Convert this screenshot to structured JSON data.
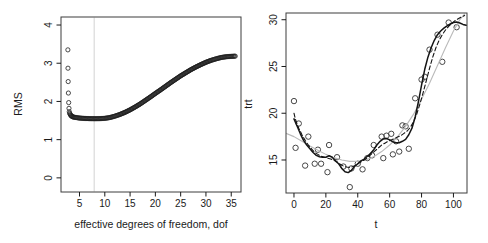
{
  "figure": {
    "background": "#ffffff",
    "width": 488,
    "height": 243
  },
  "chart_data": [
    {
      "type": "scatter",
      "title": "",
      "xlabel": "effective degrees of freedom, dof",
      "ylabel": "RMS",
      "xticks": [
        5,
        10,
        15,
        20,
        25,
        30,
        35
      ],
      "yticks": [
        0,
        1,
        2,
        3,
        4
      ],
      "xlim": [
        1.34,
        36.93
      ],
      "ylim": [
        -0.37,
        4.21
      ],
      "grid": false,
      "legend": "none",
      "marker": "open-circle",
      "ref_line": {
        "x": 7.9,
        "color": "#d6d6d6",
        "note": "vertical light line marking minimum-RMS dof"
      },
      "points": [
        [
          2.7,
          3.35
        ],
        [
          2.72,
          2.87
        ],
        [
          2.76,
          2.52
        ],
        [
          2.8,
          2.22
        ],
        [
          2.86,
          1.97
        ],
        [
          2.92,
          1.82
        ],
        [
          2.98,
          1.73
        ]
      ],
      "curve_of_overlapping_circles": [
        [
          3.05,
          1.69
        ],
        [
          3.3,
          1.63
        ],
        [
          3.6,
          1.6
        ],
        [
          4.0,
          1.585
        ],
        [
          4.5,
          1.575
        ],
        [
          5,
          1.565
        ],
        [
          6,
          1.555
        ],
        [
          7,
          1.55
        ],
        [
          8,
          1.548
        ],
        [
          9,
          1.55
        ],
        [
          10,
          1.558
        ],
        [
          11,
          1.578
        ],
        [
          12,
          1.615
        ],
        [
          13,
          1.66
        ],
        [
          14,
          1.715
        ],
        [
          15,
          1.78
        ],
        [
          16,
          1.855
        ],
        [
          17,
          1.935
        ],
        [
          18,
          2.025
        ],
        [
          19,
          2.115
        ],
        [
          20,
          2.21
        ],
        [
          21,
          2.3
        ],
        [
          22,
          2.395
        ],
        [
          23,
          2.49
        ],
        [
          24,
          2.58
        ],
        [
          25,
          2.67
        ],
        [
          26,
          2.75
        ],
        [
          27,
          2.83
        ],
        [
          28,
          2.9
        ],
        [
          29,
          2.965
        ],
        [
          30,
          3.025
        ],
        [
          31,
          3.075
        ],
        [
          32,
          3.115
        ],
        [
          33,
          3.15
        ],
        [
          34,
          3.17
        ],
        [
          35,
          3.18
        ],
        [
          35.8,
          3.185
        ]
      ]
    },
    {
      "type": "scatter",
      "title": "",
      "xlabel": "t",
      "ylabel": "trt",
      "xticks": [
        0,
        20,
        40,
        60,
        80,
        100
      ],
      "yticks": [
        15,
        20,
        25,
        30
      ],
      "xlim": [
        -5.0,
        108.5
      ],
      "ylim": [
        11.47,
        30.72
      ],
      "grid": false,
      "legend": "none",
      "marker": "open-circle",
      "points": [
        [
          0,
          21.3
        ],
        [
          1,
          16.3
        ],
        [
          3,
          18.9
        ],
        [
          7,
          14.4
        ],
        [
          9,
          17.5
        ],
        [
          13,
          14.6
        ],
        [
          15,
          16.1
        ],
        [
          17,
          14.6
        ],
        [
          21,
          13.7
        ],
        [
          22,
          16.6
        ],
        [
          27,
          15.3
        ],
        [
          31,
          14.3
        ],
        [
          35,
          12.1
        ],
        [
          36,
          14.1
        ],
        [
          40,
          14.6
        ],
        [
          43,
          14.0
        ],
        [
          46,
          15.2
        ],
        [
          49,
          15.5
        ],
        [
          50,
          16.6
        ],
        [
          55,
          17.5
        ],
        [
          56,
          15.2
        ],
        [
          58,
          17.6
        ],
        [
          61,
          17.8
        ],
        [
          62,
          15.6
        ],
        [
          64,
          17.0
        ],
        [
          66,
          15.9
        ],
        [
          68,
          18.7
        ],
        [
          70,
          18.6
        ],
        [
          72,
          16.2
        ],
        [
          76,
          21.6
        ],
        [
          80,
          23.6
        ],
        [
          82,
          23.9
        ],
        [
          85,
          26.8
        ],
        [
          90,
          28.4
        ],
        [
          93,
          25.5
        ],
        [
          97,
          29.7
        ],
        [
          102,
          29.2
        ]
      ],
      "series": [
        {
          "name": "thick-solid-smoother",
          "style": "solid",
          "color": "#141414",
          "width": 1.5,
          "points": [
            [
              0,
              19.4
            ],
            [
              2,
              18.6
            ],
            [
              4,
              17.8
            ],
            [
              6,
              17.1
            ],
            [
              8,
              16.6
            ],
            [
              10,
              16.2
            ],
            [
              12,
              15.8
            ],
            [
              14,
              15.5
            ],
            [
              16,
              15.35
            ],
            [
              18,
              15.3
            ],
            [
              20,
              15.3
            ],
            [
              22,
              15.45
            ],
            [
              24,
              15.3
            ],
            [
              26,
              14.9
            ],
            [
              28,
              14.6
            ],
            [
              30,
              14.1
            ],
            [
              32,
              13.75
            ],
            [
              34,
              13.65
            ],
            [
              36,
              13.9
            ],
            [
              38,
              14.3
            ],
            [
              40,
              14.6
            ],
            [
              42,
              14.9
            ],
            [
              44,
              15.1
            ],
            [
              46,
              15.4
            ],
            [
              48,
              15.7
            ],
            [
              50,
              16.1
            ],
            [
              52,
              16.6
            ],
            [
              54,
              17.0
            ],
            [
              56,
              17.25
            ],
            [
              58,
              17.3
            ],
            [
              60,
              17.15
            ],
            [
              62,
              16.95
            ],
            [
              64,
              16.85
            ],
            [
              66,
              16.85
            ],
            [
              68,
              17.0
            ],
            [
              70,
              17.2
            ],
            [
              72,
              17.7
            ],
            [
              74,
              18.4
            ],
            [
              76,
              19.6
            ],
            [
              78,
              21.2
            ],
            [
              80,
              23.0
            ],
            [
              82,
              24.7
            ],
            [
              84,
              26.0
            ],
            [
              86,
              27.0
            ],
            [
              88,
              27.8
            ],
            [
              90,
              28.4
            ],
            [
              92,
              28.8
            ],
            [
              94,
              29.1
            ],
            [
              96,
              29.35
            ],
            [
              98,
              29.55
            ],
            [
              100,
              29.7
            ],
            [
              102,
              29.75
            ],
            [
              104,
              29.65
            ],
            [
              106,
              29.5
            ],
            [
              108,
              29.4
            ]
          ]
        },
        {
          "name": "dashed-smoother",
          "style": "dashed",
          "color": "#141414",
          "width": 1.1,
          "points": [
            [
              0,
              20.0
            ],
            [
              1,
              19.3
            ],
            [
              3,
              18.4
            ],
            [
              5,
              17.7
            ],
            [
              7,
              17.1
            ],
            [
              9,
              16.6
            ],
            [
              11,
              16.2
            ],
            [
              13,
              15.8
            ],
            [
              15,
              15.6
            ],
            [
              17,
              15.4
            ],
            [
              19,
              15.3
            ],
            [
              21,
              15.2
            ],
            [
              23,
              15.1
            ],
            [
              25,
              15.0
            ],
            [
              27,
              14.8
            ],
            [
              29,
              14.55
            ],
            [
              31,
              14.35
            ],
            [
              33,
              14.25
            ],
            [
              35,
              14.2
            ],
            [
              37,
              14.3
            ],
            [
              39,
              14.45
            ],
            [
              41,
              14.7
            ],
            [
              43,
              14.9
            ],
            [
              45,
              15.1
            ],
            [
              47,
              15.4
            ],
            [
              49,
              15.7
            ],
            [
              51,
              16.0
            ],
            [
              53,
              16.3
            ],
            [
              55,
              16.6
            ],
            [
              57,
              16.8
            ],
            [
              59,
              17.0
            ],
            [
              61,
              17.15
            ],
            [
              63,
              17.3
            ],
            [
              65,
              17.45
            ],
            [
              67,
              17.6
            ],
            [
              69,
              17.85
            ],
            [
              71,
              18.1
            ],
            [
              73,
              18.5
            ],
            [
              75,
              19.1
            ],
            [
              77,
              19.9
            ],
            [
              79,
              21.0
            ],
            [
              81,
              22.2
            ],
            [
              83,
              23.5
            ],
            [
              85,
              24.8
            ],
            [
              87,
              26.0
            ],
            [
              89,
              27.0
            ],
            [
              91,
              27.8
            ],
            [
              93,
              28.4
            ],
            [
              95,
              28.9
            ],
            [
              97,
              29.3
            ],
            [
              99,
              29.6
            ],
            [
              101,
              29.9
            ],
            [
              103,
              30.1
            ],
            [
              105,
              30.3
            ],
            [
              107,
              30.45
            ]
          ]
        },
        {
          "name": "thin-gray-smoother",
          "style": "solid",
          "color": "#bababa",
          "width": 1.1,
          "points": [
            [
              -5,
              17.85
            ],
            [
              0,
              17.5
            ],
            [
              5,
              17.0
            ],
            [
              10,
              16.5
            ],
            [
              15,
              16.05
            ],
            [
              20,
              15.6
            ],
            [
              25,
              15.25
            ],
            [
              30,
              15.0
            ],
            [
              35,
              14.85
            ],
            [
              40,
              14.85
            ],
            [
              45,
              15.0
            ],
            [
              50,
              15.35
            ],
            [
              55,
              15.9
            ],
            [
              60,
              16.6
            ],
            [
              65,
              17.5
            ],
            [
              70,
              18.6
            ],
            [
              75,
              19.9
            ],
            [
              80,
              21.5
            ],
            [
              85,
              23.2
            ],
            [
              90,
              25.1
            ],
            [
              95,
              27.0
            ],
            [
              100,
              28.8
            ],
            [
              104,
              30.0
            ],
            [
              107,
              30.6
            ]
          ]
        }
      ]
    }
  ]
}
